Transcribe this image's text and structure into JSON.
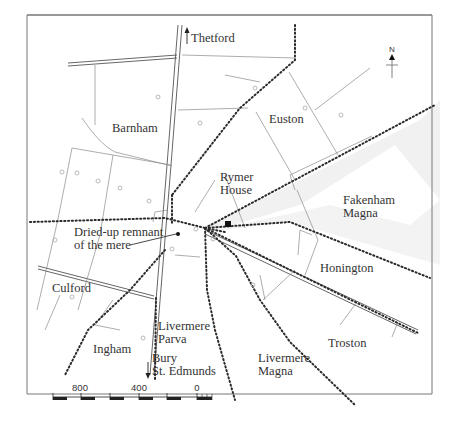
{
  "map": {
    "type": "historical parish map",
    "place_labels": [
      {
        "id": "thetford",
        "text": "Thetford",
        "direction": "north",
        "has_arrow": true
      },
      {
        "id": "barnham",
        "text": "Barnham"
      },
      {
        "id": "euston",
        "text": "Euston"
      },
      {
        "id": "rymer-house-1",
        "text": "Rymer"
      },
      {
        "id": "rymer-house-2",
        "text": "House"
      },
      {
        "id": "fakenham-1",
        "text": "Fakenham"
      },
      {
        "id": "fakenham-2",
        "text": "Magna"
      },
      {
        "id": "mere-1",
        "text": "Dried-up remnant"
      },
      {
        "id": "mere-2",
        "text": "of the mere"
      },
      {
        "id": "honington",
        "text": "Honington"
      },
      {
        "id": "culford",
        "text": "Culford"
      },
      {
        "id": "livermere-parva-1",
        "text": "Livermere"
      },
      {
        "id": "livermere-parva-2",
        "text": "Parva"
      },
      {
        "id": "ingham",
        "text": "Ingham"
      },
      {
        "id": "bury-1",
        "text": "Bury"
      },
      {
        "id": "bury-2",
        "text": "St. Edmunds"
      },
      {
        "id": "livermere-magna-1",
        "text": "Livermere"
      },
      {
        "id": "livermere-magna-2",
        "text": "Magna"
      },
      {
        "id": "troston",
        "text": "Troston"
      }
    ],
    "north_arrow": {
      "label": "N",
      "icon": "north-arrow-icon"
    },
    "scale_bar": {
      "ticks": [
        "800",
        "400",
        "0"
      ],
      "segments": 7
    },
    "markers": [
      {
        "id": "rymer-house-marker",
        "icon": "square-marker-icon",
        "meaning": "Rymer House"
      },
      {
        "id": "mere-marker",
        "icon": "small-dot-icon",
        "meaning": "Dried-up remnant of the mere"
      }
    ],
    "colors": {
      "boundary": "#2a2a2a",
      "field_line": "#8a8a8a",
      "road": "#555555",
      "shading": "#efefef",
      "text": "#333333"
    }
  }
}
